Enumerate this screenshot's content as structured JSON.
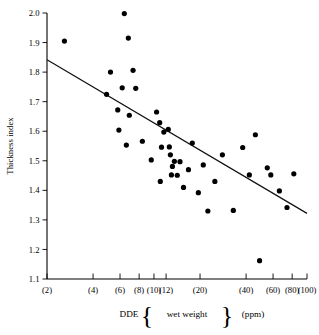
{
  "figure": {
    "title": "",
    "y_axis_label": "Thickness index",
    "x_axis_label_parts": {
      "prefix": "DDE",
      "brace_open": "{",
      "inner": "wet weight",
      "brace_close": "}",
      "suffix": "(ppm)"
    },
    "x_axis_label_full": "DDE {wet weight} (ppm)"
  },
  "chart_data": {
    "type": "scatter",
    "title": "",
    "xlabel": "DDE {wet weight} (ppm)",
    "ylabel": "Thickness index",
    "xscale": "log",
    "yscale": "linear",
    "xlim": [
      2,
      100
    ],
    "ylim": [
      1.1,
      2.0
    ],
    "grid": false,
    "legend": "none",
    "x_tick_values": [
      2,
      4,
      6,
      8,
      10,
      12,
      20,
      40,
      60,
      80,
      100
    ],
    "x_tick_labels": [
      "(2)",
      "(4)",
      "(6)",
      "(8)",
      "(10)",
      "(12)",
      "(20)",
      "(40)",
      "(60)",
      "(80)",
      "(100)"
    ],
    "y_tick_values": [
      1.1,
      1.2,
      1.3,
      1.4,
      1.5,
      1.6,
      1.7,
      1.8,
      1.9,
      2.0
    ],
    "y_tick_labels": [
      "1.1",
      "1.2",
      "1.3",
      "1.4",
      "1.5",
      "1.6",
      "1.7",
      "1.8",
      "1.9",
      "2.0"
    ],
    "series": [
      {
        "name": "eggshell samples",
        "marker": "filled-circle",
        "color": "#000000",
        "points": [
          [
            2.6,
            1.905
          ],
          [
            6.8,
            1.915
          ],
          [
            6.4,
            1.998
          ],
          [
            5.2,
            1.8
          ],
          [
            7.3,
            1.806
          ],
          [
            4.9,
            1.725
          ],
          [
            6.2,
            1.747
          ],
          [
            7.6,
            1.745
          ],
          [
            5.8,
            1.672
          ],
          [
            6.9,
            1.654
          ],
          [
            5.9,
            1.604
          ],
          [
            6.6,
            1.553
          ],
          [
            8.4,
            1.566
          ],
          [
            9.6,
            1.503
          ],
          [
            10.4,
            1.665
          ],
          [
            10.9,
            1.629
          ],
          [
            11.6,
            1.597
          ],
          [
            11.2,
            1.546
          ],
          [
            12.4,
            1.606
          ],
          [
            12.6,
            1.547
          ],
          [
            12.8,
            1.52
          ],
          [
            13.2,
            1.481
          ],
          [
            13.6,
            1.498
          ],
          [
            13.0,
            1.452
          ],
          [
            14.2,
            1.451
          ],
          [
            14.8,
            1.497
          ],
          [
            11.0,
            1.43
          ],
          [
            15.6,
            1.41
          ],
          [
            16.8,
            1.47
          ],
          [
            17.8,
            1.56
          ],
          [
            19.5,
            1.392
          ],
          [
            21.0,
            1.486
          ],
          [
            22.5,
            1.33
          ],
          [
            25.0,
            1.43
          ],
          [
            28.0,
            1.52
          ],
          [
            33.0,
            1.332
          ],
          [
            38.0,
            1.545
          ],
          [
            42.0,
            1.452
          ],
          [
            46.0,
            1.588
          ],
          [
            49.0,
            1.162
          ],
          [
            55.0,
            1.476
          ],
          [
            58.0,
            1.452
          ],
          [
            66.0,
            1.398
          ],
          [
            74.0,
            1.342
          ],
          [
            82.0,
            1.456
          ]
        ]
      }
    ],
    "fit_line": {
      "type": "linear-regression-on-log-x",
      "endpoints": [
        [
          2,
          1.842
        ],
        [
          100,
          1.322
        ]
      ]
    }
  }
}
